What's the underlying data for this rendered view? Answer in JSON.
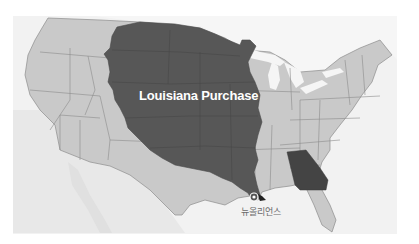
{
  "map": {
    "title": "Louisiana Purchase",
    "region_label": "Louisiana Purchase",
    "city_marker": {
      "label": "뉴올리언스",
      "icon": "location-pin-icon"
    },
    "highlighted_state": "Georgia",
    "colors": {
      "background": "#ffffff",
      "ocean": "#f1f1f1",
      "land": "#c9c9c9",
      "mexico_canada": "#e4e4e4",
      "purchase": "#575757",
      "georgia": "#444444",
      "borders": "#8c8c8c",
      "lakes": "#f5f5f5"
    }
  }
}
